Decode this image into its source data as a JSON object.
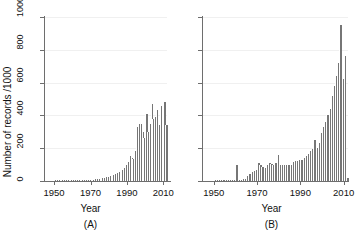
{
  "figure": {
    "background": "#ffffff",
    "bar_color": "#767676",
    "axis_color": "#6e6e6e",
    "grid_color": "#f0f0f0"
  },
  "panels": [
    {
      "id": "A",
      "tag": "(A)",
      "xlabel": "Year",
      "ylabel": "Number of records /1000",
      "show_y_labels": true
    },
    {
      "id": "B",
      "tag": "(B)",
      "xlabel": "Year",
      "ylabel": "",
      "show_y_labels": false
    }
  ],
  "axis": {
    "y_ticks": [
      0,
      200,
      400,
      600,
      800,
      1000
    ],
    "y_tick_labels": [
      "0",
      "200",
      "400",
      "600",
      "800",
      "1000"
    ],
    "ylim": [
      0,
      1000
    ],
    "x_ticks": [
      1950,
      1970,
      1990,
      2010
    ],
    "x_tick_labels": [
      "1950",
      "1970",
      "1990",
      "2010"
    ],
    "xlim": [
      1945,
      2012
    ]
  },
  "chart_data": [
    {
      "type": "bar",
      "title": "(A)",
      "xlabel": "Year",
      "ylabel": "Number of records /1000",
      "xlim": [
        1945,
        2012
      ],
      "ylim": [
        0,
        1000
      ],
      "grid": true,
      "legend": "none",
      "x": [
        1946,
        1947,
        1948,
        1949,
        1950,
        1951,
        1952,
        1953,
        1954,
        1955,
        1956,
        1957,
        1958,
        1959,
        1960,
        1961,
        1962,
        1963,
        1964,
        1965,
        1966,
        1967,
        1968,
        1969,
        1970,
        1971,
        1972,
        1973,
        1974,
        1975,
        1976,
        1977,
        1978,
        1979,
        1980,
        1981,
        1982,
        1983,
        1984,
        1985,
        1986,
        1987,
        1988,
        1989,
        1990,
        1991,
        1992,
        1993,
        1994,
        1995,
        1996,
        1997,
        1998,
        1999,
        2000,
        2001,
        2002,
        2003,
        2004,
        2005,
        2006,
        2007,
        2008,
        2009,
        2010,
        2011
      ],
      "values": [
        0,
        0,
        0,
        0,
        2,
        1,
        1,
        1,
        1,
        1,
        1,
        1,
        1,
        1,
        2,
        2,
        2,
        2,
        3,
        3,
        4,
        4,
        5,
        5,
        8,
        9,
        11,
        12,
        14,
        15,
        18,
        20,
        22,
        25,
        30,
        35,
        38,
        42,
        48,
        55,
        62,
        70,
        82,
        95,
        118,
        150,
        140,
        132,
        180,
        330,
        345,
        350,
        300,
        260,
        410,
        300,
        345,
        470,
        380,
        390,
        430,
        340,
        455,
        400,
        480,
        340
      ]
    },
    {
      "type": "bar",
      "title": "(B)",
      "xlabel": "Year",
      "ylabel": "Number of records /1000",
      "xlim": [
        1945,
        2012
      ],
      "ylim": [
        0,
        1000
      ],
      "grid": true,
      "legend": "none",
      "x": [
        1946,
        1947,
        1948,
        1949,
        1950,
        1951,
        1952,
        1953,
        1954,
        1955,
        1956,
        1957,
        1958,
        1959,
        1960,
        1961,
        1962,
        1963,
        1964,
        1965,
        1966,
        1967,
        1968,
        1969,
        1970,
        1971,
        1972,
        1973,
        1974,
        1975,
        1976,
        1977,
        1978,
        1979,
        1980,
        1981,
        1982,
        1983,
        1984,
        1985,
        1986,
        1987,
        1988,
        1989,
        1990,
        1991,
        1992,
        1993,
        1994,
        1995,
        1996,
        1997,
        1998,
        1999,
        2000,
        2001,
        2002,
        2003,
        2004,
        2005,
        2006,
        2007,
        2008,
        2009,
        2010,
        2011
      ],
      "values": [
        0,
        0,
        0,
        0,
        6,
        8,
        8,
        8,
        6,
        6,
        6,
        6,
        6,
        6,
        95,
        8,
        8,
        10,
        14,
        30,
        45,
        55,
        62,
        70,
        108,
        95,
        85,
        80,
        95,
        110,
        105,
        100,
        112,
        160,
        100,
        95,
        98,
        100,
        95,
        100,
        115,
        120,
        125,
        130,
        128,
        140,
        150,
        165,
        180,
        195,
        250,
        200,
        230,
        290,
        330,
        360,
        400,
        440,
        520,
        580,
        640,
        720,
        950,
        620,
        760,
        20
      ]
    }
  ]
}
